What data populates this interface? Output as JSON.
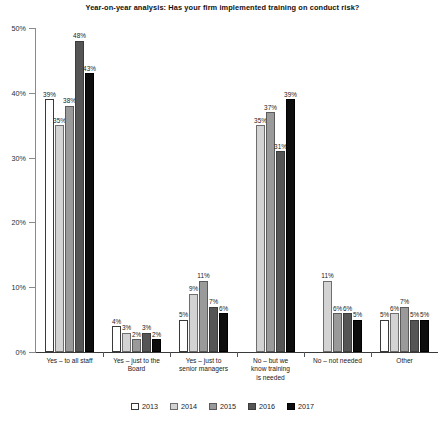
{
  "chart_data": {
    "type": "bar",
    "title": "Year-on-year analysis: Has your firm implemented training on conduct risk?",
    "subtitle": "",
    "xlabel": "",
    "ylabel": "",
    "ylim": [
      0,
      50
    ],
    "yticks": [
      "0%",
      "10%",
      "20%",
      "30%",
      "40%",
      "50%"
    ],
    "ytick_values": [
      0,
      10,
      20,
      30,
      40,
      50
    ],
    "grid": false,
    "legend_position": "bottom",
    "value_suffix": "%",
    "categories": [
      "Yes – to all staff",
      "Yes – just to the Board",
      "Yes – just to senior managers",
      "No – but we know training is needed",
      "No – not needed",
      "Other"
    ],
    "category_lines": [
      [
        "Yes – to all staff"
      ],
      [
        "Yes – just to the",
        "Board"
      ],
      [
        "Yes – just to",
        "senior managers"
      ],
      [
        "No – but we",
        "know training",
        "is needed"
      ],
      [
        "No – not needed"
      ],
      [
        "Other"
      ]
    ],
    "series": [
      {
        "name": "2013",
        "color": "#ffffff",
        "values": [
          39,
          4,
          5,
          null,
          null,
          5
        ]
      },
      {
        "name": "2014",
        "color": "#d3d3d3",
        "values": [
          35,
          3,
          9,
          35,
          11,
          6
        ]
      },
      {
        "name": "2015",
        "color": "#9a9a9a",
        "values": [
          38,
          2,
          11,
          37,
          6,
          7
        ]
      },
      {
        "name": "2016",
        "color": "#555555",
        "values": [
          48,
          3,
          7,
          31,
          6,
          5
        ]
      },
      {
        "name": "2017",
        "color": "#0d0d0d",
        "values": [
          43,
          2,
          6,
          39,
          5,
          5
        ]
      }
    ],
    "data_labels": [
      [
        "39%",
        "4%",
        "5%",
        "",
        "",
        "5%"
      ],
      [
        "35%",
        "3%",
        "9%",
        "35%",
        "11%",
        "6%"
      ],
      [
        "38%",
        "2%",
        "11%",
        "37%",
        "6%",
        "7%"
      ],
      [
        "48%",
        "3%",
        "7%",
        "31%",
        "6%",
        "5%"
      ],
      [
        "43%",
        "2%",
        "6%",
        "39%",
        "5%",
        "5%"
      ]
    ]
  },
  "legend": {
    "entries": [
      {
        "label": "2013"
      },
      {
        "label": "2014"
      },
      {
        "label": "2015"
      },
      {
        "label": "2016"
      },
      {
        "label": "2017"
      }
    ]
  }
}
